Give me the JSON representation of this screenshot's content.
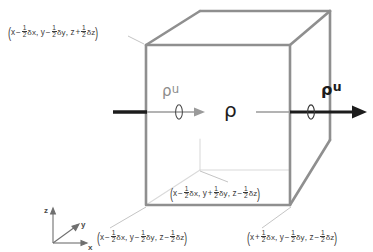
{
  "figure": {
    "colors": {
      "cube_edge_visible": "#8c8c8c",
      "cube_edge_hidden": "#d8d8d8",
      "flux_arrow_outer": "#1c1c1c",
      "flux_arrow_inner": "#8c8c8c",
      "leader_line": "#b4b4b4",
      "text": "#3a3a3a",
      "background": "#ffffff"
    }
  },
  "labels": {
    "corner_top_left": {
      "name": "(x - 1/2 dx, y - 1/2 dy, z + 1/2 dz)",
      "open": "(",
      "close": ")",
      "x_var": "x",
      "x_sign": "−",
      "x_delta": "δx",
      "sep1": ", ",
      "y_var": "y",
      "y_sign": "−",
      "y_delta": "δy",
      "sep2": ", ",
      "z_var": "z",
      "z_sign": "+",
      "z_delta": "δz",
      "num": "1",
      "den": "2"
    },
    "corner_bottom_center": {
      "name": "(x - 1/2 dx, y + 1/2 dy, z - 1/2 dz)",
      "open": "(",
      "close": ")",
      "x_var": "x",
      "x_sign": "−",
      "x_delta": "δx",
      "sep1": ", ",
      "y_var": "y",
      "y_sign": "+",
      "y_delta": "δy",
      "sep2": ", ",
      "z_var": "z",
      "z_sign": "−",
      "z_delta": "δz",
      "num": "1",
      "den": "2"
    },
    "corner_bottom_left": {
      "name": "(x - 1/2 dx, y - 1/2 dy, z - 1/2 dz)",
      "open": "(",
      "close": ")",
      "x_var": "x",
      "x_sign": "−",
      "x_delta": "δx",
      "sep1": ", ",
      "y_var": "y",
      "y_sign": "−",
      "y_delta": "δy",
      "sep2": ", ",
      "z_var": "z",
      "z_sign": "−",
      "z_delta": "δz",
      "num": "1",
      "den": "2"
    },
    "corner_bottom_right": {
      "name": "(x + 1/2 dx, y - 1/2 dy, z - 1/2 dz)",
      "open": "(",
      "close": ")",
      "x_var": "x",
      "x_sign": "+",
      "x_delta": "δx",
      "sep1": ", ",
      "y_var": "y",
      "y_sign": "−",
      "y_delta": "δy",
      "sep2": ", ",
      "z_var": "z",
      "z_sign": "−",
      "z_delta": "δz",
      "num": "1",
      "den": "2"
    }
  },
  "symbols": {
    "density_center": "ρ",
    "flux_in_rho": "ρ",
    "flux_in_u": "u",
    "flux_out_rho": "ρ",
    "flux_out_u": "u"
  },
  "axes": {
    "z": "z",
    "y": "y",
    "x": "x"
  }
}
